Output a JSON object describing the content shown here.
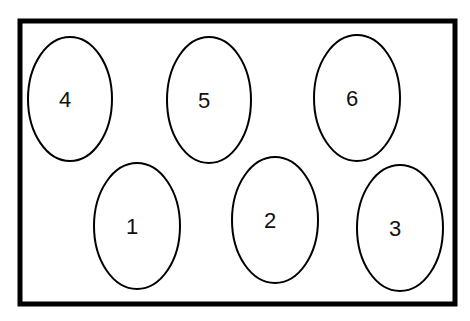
{
  "diagram": {
    "frame": {
      "x": 20,
      "y": 21,
      "width": 435,
      "height": 283,
      "stroke": "#000000",
      "stroke_width": 5
    },
    "ellipses": [
      {
        "label": "4",
        "cx": 70,
        "cy": 99,
        "rx": 42,
        "ry": 62
      },
      {
        "label": "5",
        "cx": 209,
        "cy": 100,
        "rx": 42,
        "ry": 63
      },
      {
        "label": "6",
        "cx": 357,
        "cy": 98,
        "rx": 43,
        "ry": 63
      },
      {
        "label": "1",
        "cx": 137,
        "cy": 226,
        "rx": 43,
        "ry": 63
      },
      {
        "label": "2",
        "cx": 275,
        "cy": 220,
        "rx": 43,
        "ry": 63
      },
      {
        "label": "3",
        "cx": 400,
        "cy": 228,
        "rx": 43,
        "ry": 63
      }
    ],
    "colors": {
      "stroke": "#000000",
      "background": "#ffffff",
      "text": "#111111"
    }
  }
}
